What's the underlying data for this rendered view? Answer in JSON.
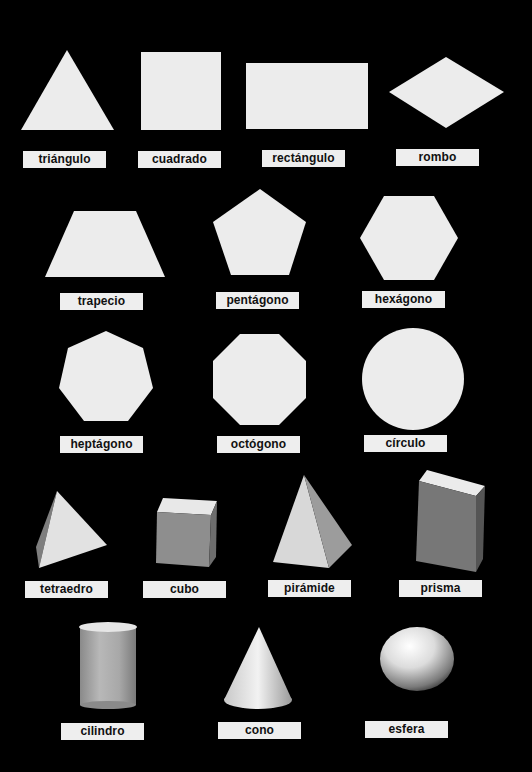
{
  "sheet": {
    "background": "#000000",
    "shape_fill": "#ececec",
    "label_fill": "#eeeeee",
    "rows": [
      {
        "category": "2D shapes",
        "items": [
          {
            "id": "triangle",
            "label": "triángulo"
          },
          {
            "id": "square",
            "label": "cuadrado"
          },
          {
            "id": "rectangle",
            "label": "rectángulo"
          },
          {
            "id": "rhombus",
            "label": "rombo"
          }
        ]
      },
      {
        "category": "2D shapes",
        "items": [
          {
            "id": "trapezoid",
            "label": "trapecio"
          },
          {
            "id": "pentagon",
            "label": "pentágono"
          },
          {
            "id": "hexagon",
            "label": "hexágono"
          }
        ]
      },
      {
        "category": "2D shapes",
        "items": [
          {
            "id": "heptagon",
            "label": "heptágono"
          },
          {
            "id": "octagon",
            "label": "octógono"
          },
          {
            "id": "circle",
            "label": "círculo"
          }
        ]
      },
      {
        "category": "3D solids",
        "items": [
          {
            "id": "tetrahedron",
            "label": "tetraedro"
          },
          {
            "id": "cube",
            "label": "cubo"
          },
          {
            "id": "pyramid",
            "label": "pirámide"
          },
          {
            "id": "prism",
            "label": "prisma"
          }
        ]
      },
      {
        "category": "3D solids",
        "items": [
          {
            "id": "cylinder",
            "label": "cilindro"
          },
          {
            "id": "cone",
            "label": "cono"
          },
          {
            "id": "sphere",
            "label": "esfera"
          }
        ]
      }
    ]
  }
}
